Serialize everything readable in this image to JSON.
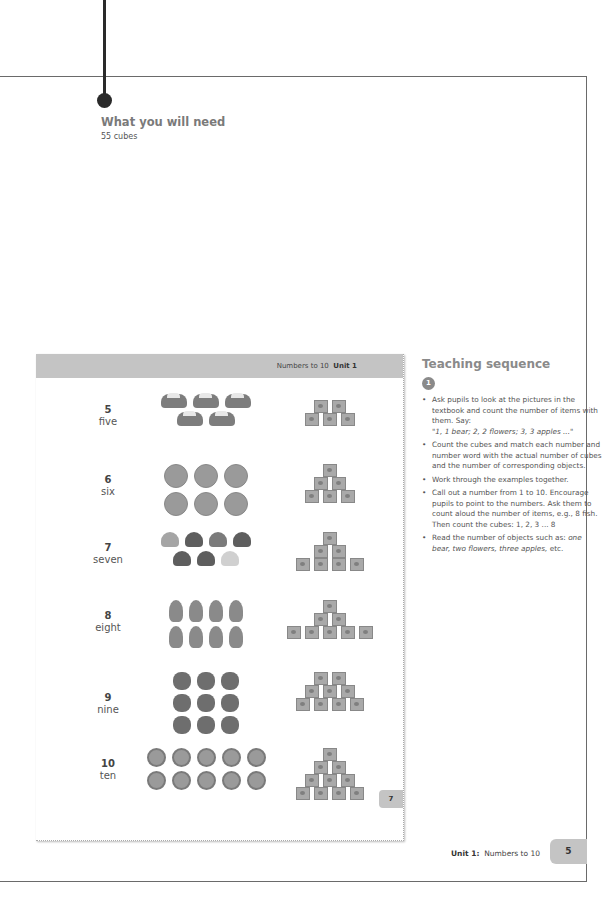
{
  "what_you_need": {
    "title": "What you will need",
    "items": [
      "55 cubes"
    ]
  },
  "textbook_page": {
    "header_topic": "Numbers to 10",
    "header_unit": "Unit 1",
    "page_number": "7",
    "rows": [
      {
        "digit": "5",
        "word": "five",
        "object": "car",
        "object_lines": [
          3,
          2
        ],
        "cube_rows": [
          2,
          3
        ]
      },
      {
        "digit": "6",
        "word": "six",
        "object": "apple",
        "object_lines": [
          3,
          3
        ],
        "cube_rows": [
          1,
          2,
          3
        ]
      },
      {
        "digit": "7",
        "word": "seven",
        "object": "shell",
        "object_lines": [
          4,
          3
        ],
        "cube_rows": [
          1,
          2,
          4
        ]
      },
      {
        "digit": "8",
        "word": "eight",
        "object": "fish",
        "object_lines": [
          4,
          4
        ],
        "cube_rows": [
          1,
          2,
          5
        ]
      },
      {
        "digit": "9",
        "word": "nine",
        "object": "raspberry",
        "object_lines": [
          3,
          3,
          3
        ],
        "cube_rows": [
          2,
          3,
          4
        ]
      },
      {
        "digit": "10",
        "word": "ten",
        "object": "coin",
        "object_lines": [
          5,
          5
        ],
        "cube_rows": [
          1,
          2,
          3,
          4
        ]
      }
    ]
  },
  "teaching_sequence": {
    "title": "Teaching sequence",
    "step_badge": "1",
    "bullets": [
      {
        "text": "Ask pupils to look at the pictures in the textbook and count the number of items with them. Say:",
        "italic": "\"1, 1 bear; 2, 2 flowers; 3, 3 apples ...\""
      },
      {
        "text": "Count the cubes and match each number and number word with the actual number of cubes and the number of corresponding objects.",
        "italic": ""
      },
      {
        "text": "Work through the examples together.",
        "italic": ""
      },
      {
        "text": "Call out a number from 1 to 10. Encourage pupils to point to the numbers. Ask them to count aloud the number of items, e.g., 8 fish. Then count the cubes: 1, 2, 3 ... 8",
        "italic": ""
      },
      {
        "text": "Read the number of objects such as:",
        "italic": "one bear, two flowers, three apples,",
        "tail": "etc."
      }
    ]
  },
  "footer": {
    "unit": "Unit 1:",
    "topic": "Numbers to 10",
    "page_number": "5"
  }
}
